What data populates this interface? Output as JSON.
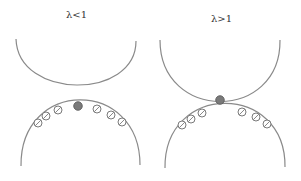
{
  "panels": [
    {
      "label": "λ<1",
      "label_pos": [
        66,
        9
      ],
      "upper_surface": "M16,39 C18,100 136,100 136,41",
      "lower_surface": "M21,166 C20,78 140,78 140,165",
      "filled_particle": {
        "cx": 78,
        "cy": 106
      },
      "open_particles": [
        {
          "cx": 38,
          "cy": 123
        },
        {
          "cx": 46,
          "cy": 116
        },
        {
          "cx": 58,
          "cy": 110
        },
        {
          "cx": 97,
          "cy": 109
        },
        {
          "cx": 111,
          "cy": 115
        },
        {
          "cx": 122,
          "cy": 122
        }
      ]
    },
    {
      "label": "λ>1",
      "label_pos": [
        211,
        13
      ],
      "upper_surface": "M160,40 C160,122 281,122 280,40",
      "lower_surface": "M165,168 C164,82 286,82 285,167",
      "filled_particle": {
        "cx": 220,
        "cy": 100
      },
      "open_particles": [
        {
          "cx": 182,
          "cy": 125
        },
        {
          "cx": 191,
          "cy": 119
        },
        {
          "cx": 202,
          "cy": 113
        },
        {
          "cx": 242,
          "cy": 112
        },
        {
          "cx": 256,
          "cy": 117
        },
        {
          "cx": 267,
          "cy": 124
        }
      ]
    }
  ],
  "colors": {
    "line": "#8a8a8a",
    "filled_particle": "#7a7a7a",
    "open_particle_stroke": "#7a7a7a",
    "text": "#333333"
  }
}
